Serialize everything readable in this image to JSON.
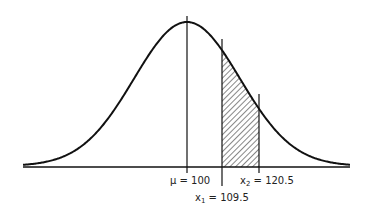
{
  "diagram": {
    "type": "normal-distribution",
    "mean_label": "μ = 100",
    "x1_label_var": "x",
    "x1_label_sub": "1",
    "x1_label_val": " = 109.5",
    "x2_label_var": "x",
    "x2_label_sub": "2",
    "x2_label_val": " = 120.5",
    "mean": 100,
    "x1": 109.5,
    "x2": 120.5,
    "shaded_region": "between x1 and x2",
    "colors": {
      "line": "#111111",
      "background": "#ffffff"
    }
  }
}
